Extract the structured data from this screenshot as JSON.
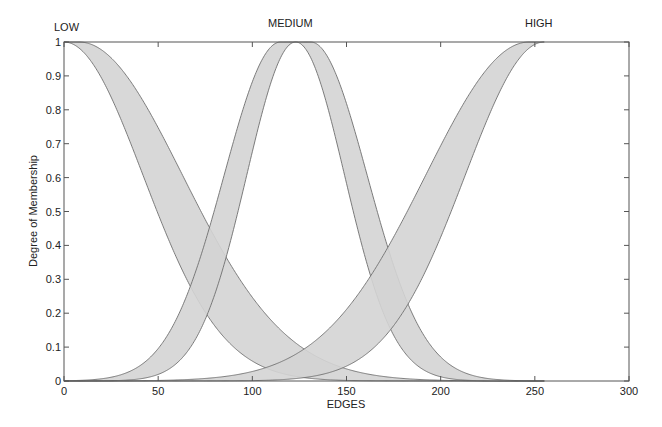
{
  "chart_data": {
    "type": "area",
    "title": "",
    "xlabel": "EDGES",
    "ylabel": "Degree of Membership",
    "xlim": [
      0,
      300
    ],
    "ylim": [
      0,
      1
    ],
    "xticks": [
      0,
      50,
      100,
      150,
      200,
      250,
      300
    ],
    "yticks": [
      0,
      0.1,
      0.2,
      0.3,
      0.4,
      0.5,
      0.6,
      0.7,
      0.8,
      0.9,
      1
    ],
    "grid": false,
    "legend": "none",
    "series": [
      {
        "name": "LOW",
        "label_x": 0,
        "shape": "gaussian-fou",
        "upper": {
          "mean_lo": 0,
          "mean_hi": 8,
          "sigma": 55
        },
        "lower": {
          "mean": 0,
          "sigma": 42
        },
        "range": [
          0,
          255
        ]
      },
      {
        "name": "MEDIUM",
        "label_x": 127,
        "shape": "gaussian-fou",
        "upper": {
          "mean_lo": 115,
          "mean_hi": 131,
          "sigma": 30
        },
        "lower": {
          "mean": 123,
          "sigma": 26
        },
        "range": [
          0,
          255
        ]
      },
      {
        "name": "HIGH",
        "label_x": 255,
        "shape": "gaussian-fou",
        "upper": {
          "mean_lo": 247,
          "mean_hi": 255,
          "sigma": 55
        },
        "lower": {
          "mean": 255,
          "sigma": 42
        },
        "range": [
          0,
          255
        ]
      }
    ],
    "colors": {
      "fill": "#d4d4d4",
      "stroke": "#6e6e6e",
      "axis": "#555555"
    }
  },
  "labels": {
    "low": "LOW",
    "medium": "MEDIUM",
    "high": "HIGH",
    "xlabel": "EDGES",
    "ylabel": "Degree of Membership"
  }
}
